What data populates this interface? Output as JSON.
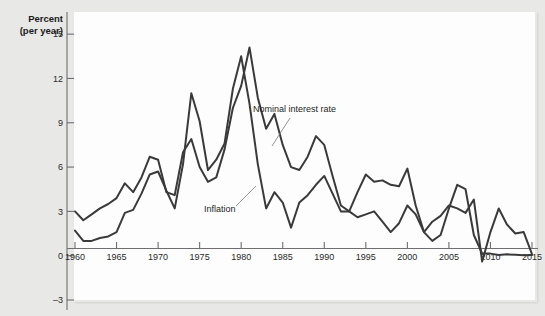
{
  "figure": {
    "background_color": "#e8e8e6",
    "panel_color": "#fdfdfd",
    "line_color": "#3a3a3a",
    "axis_color": "#6e6e70"
  },
  "axis": {
    "y_title_line1": "Percent",
    "y_title_line2": "(per year)",
    "y_ticks": [
      "15",
      "12",
      "9",
      "6",
      "3",
      "0",
      "–3"
    ],
    "x_ticks": [
      "1960",
      "1965",
      "1970",
      "1975",
      "1980",
      "1985",
      "1990",
      "1995",
      "2000",
      "2005",
      "2010",
      "2015"
    ]
  },
  "annotations": {
    "nominal_label": "Nominal interest rate",
    "inflation_label": "Inflation"
  },
  "chart_data": {
    "type": "line",
    "title": "",
    "xlabel": "",
    "ylabel": "Percent (per year)",
    "xlim": [
      1960,
      2015
    ],
    "ylim": [
      -3,
      16.5
    ],
    "grid": false,
    "legend": "annotated-inline",
    "y_ticks": [
      15,
      12,
      9,
      6,
      3,
      0,
      -3
    ],
    "x_ticks": [
      1960,
      1965,
      1970,
      1975,
      1980,
      1985,
      1990,
      1995,
      2000,
      2005,
      2010,
      2015
    ],
    "x": [
      1960,
      1961,
      1962,
      1963,
      1964,
      1965,
      1966,
      1967,
      1968,
      1969,
      1970,
      1971,
      1972,
      1973,
      1974,
      1975,
      1976,
      1977,
      1978,
      1979,
      1980,
      1981,
      1982,
      1983,
      1984,
      1985,
      1986,
      1987,
      1988,
      1989,
      1990,
      1991,
      1992,
      1993,
      1994,
      1995,
      1996,
      1997,
      1998,
      1999,
      2000,
      2001,
      2002,
      2003,
      2004,
      2005,
      2006,
      2007,
      2008,
      2009,
      2010,
      2011,
      2012,
      2013,
      2014,
      2015
    ],
    "series": [
      {
        "name": "Nominal interest rate",
        "values": [
          3.0,
          2.4,
          2.8,
          3.2,
          3.5,
          3.9,
          4.9,
          4.3,
          5.3,
          6.7,
          6.5,
          4.3,
          4.1,
          7.0,
          7.9,
          6.0,
          5.0,
          5.3,
          7.2,
          10.0,
          11.5,
          14.1,
          10.7,
          8.6,
          9.6,
          7.5,
          6.0,
          5.8,
          6.7,
          8.1,
          7.5,
          5.4,
          3.4,
          3.0,
          4.3,
          5.5,
          5.0,
          5.1,
          4.8,
          4.7,
          5.9,
          3.4,
          1.6,
          1.0,
          1.4,
          3.2,
          4.8,
          4.5,
          1.4,
          0.15,
          0.14,
          0.05,
          0.09,
          0.06,
          0.03,
          0.05
        ]
      },
      {
        "name": "Inflation",
        "values": [
          1.7,
          1.0,
          1.0,
          1.2,
          1.3,
          1.6,
          2.9,
          3.1,
          4.2,
          5.5,
          5.7,
          4.4,
          3.2,
          6.2,
          11.0,
          9.1,
          5.8,
          6.5,
          7.6,
          11.3,
          13.5,
          10.3,
          6.2,
          3.2,
          4.3,
          3.6,
          1.9,
          3.6,
          4.1,
          4.8,
          5.4,
          4.2,
          3.0,
          3.0,
          2.6,
          2.8,
          3.0,
          2.3,
          1.6,
          2.2,
          3.4,
          2.8,
          1.6,
          2.3,
          2.7,
          3.4,
          3.2,
          2.9,
          3.8,
          -0.4,
          1.6,
          3.2,
          2.1,
          1.5,
          1.6,
          0.1
        ]
      }
    ]
  }
}
